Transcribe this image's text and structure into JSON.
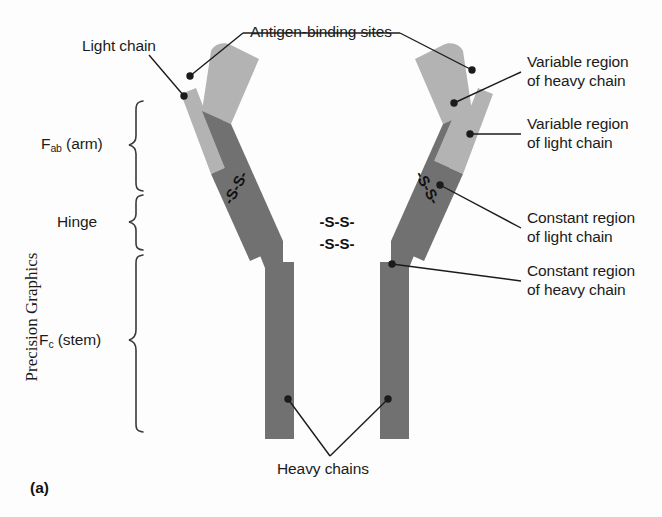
{
  "figure": {
    "panel_letter": "(a)",
    "credit": "Precision Graphics"
  },
  "colors": {
    "variable_region": "#b3b3b3",
    "constant_region": "#717171",
    "leader_line": "#1b1b1b",
    "text": "#1b1b1b",
    "background": "#fdfdfd",
    "bracket": "#3a3a3a"
  },
  "labels": {
    "light_chain": "Light chain",
    "antigen_binding_sites": "Antigen-binding sites",
    "variable_heavy_line1": "Variable region",
    "variable_heavy_line2": "of heavy chain",
    "variable_light_line1": "Variable region",
    "variable_light_line2": "of light chain",
    "constant_light_line1": "Constant region",
    "constant_light_line2": "of light chain",
    "constant_heavy_line1": "Constant region",
    "constant_heavy_line2": "of heavy chain",
    "heavy_chains": "Heavy chains"
  },
  "regions": {
    "fab": {
      "symbol": "F",
      "subscript": "ab",
      "suffix": " (arm)"
    },
    "hinge": {
      "label": "Hinge"
    },
    "fc": {
      "symbol": "F",
      "subscript": "c",
      "suffix": " (stem)"
    }
  },
  "disulfide_bonds": {
    "glyph": "-S-S-",
    "count": 4,
    "positions": [
      "left-arm",
      "right-arm",
      "stem-upper",
      "stem-lower"
    ]
  },
  "structure": {
    "chains": [
      {
        "name": "left-light-chain",
        "type": "light"
      },
      {
        "name": "left-heavy-chain",
        "type": "heavy"
      },
      {
        "name": "right-heavy-chain",
        "type": "heavy"
      },
      {
        "name": "right-light-chain",
        "type": "light"
      }
    ]
  }
}
